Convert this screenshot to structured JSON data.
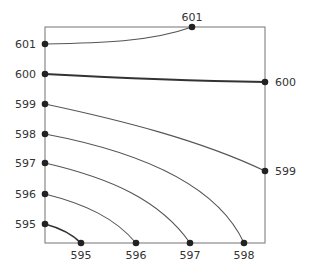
{
  "chart_data": {
    "type": "contour",
    "title": "",
    "xlabel": "",
    "ylabel": "",
    "levels": [
      {
        "value": 601,
        "bold": false,
        "start_label": "601",
        "end_label": "601",
        "start_edge": "left",
        "end_edge": "top"
      },
      {
        "value": 600,
        "bold": true,
        "start_label": "600",
        "end_label": "600",
        "start_edge": "left",
        "end_edge": "right"
      },
      {
        "value": 599,
        "bold": false,
        "start_label": "599",
        "end_label": "599",
        "start_edge": "left",
        "end_edge": "right"
      },
      {
        "value": 598,
        "bold": false,
        "start_label": "598",
        "end_label": "598",
        "start_edge": "left",
        "end_edge": "bottom"
      },
      {
        "value": 597,
        "bold": false,
        "start_label": "597",
        "end_label": "597",
        "start_edge": "left",
        "end_edge": "bottom"
      },
      {
        "value": 596,
        "bold": false,
        "start_label": "596",
        "end_label": "596",
        "start_edge": "left",
        "end_edge": "bottom"
      },
      {
        "value": 595,
        "bold": true,
        "start_label": "595",
        "end_label": "595",
        "start_edge": "left",
        "end_edge": "bottom"
      }
    ],
    "left_labels": [
      "601",
      "600",
      "599",
      "598",
      "597",
      "596",
      "595"
    ],
    "top_labels": [
      "601"
    ],
    "right_labels": [
      "600",
      "599"
    ],
    "bottom_labels": [
      "595",
      "596",
      "597",
      "598"
    ],
    "grid": false,
    "legend": "none"
  }
}
